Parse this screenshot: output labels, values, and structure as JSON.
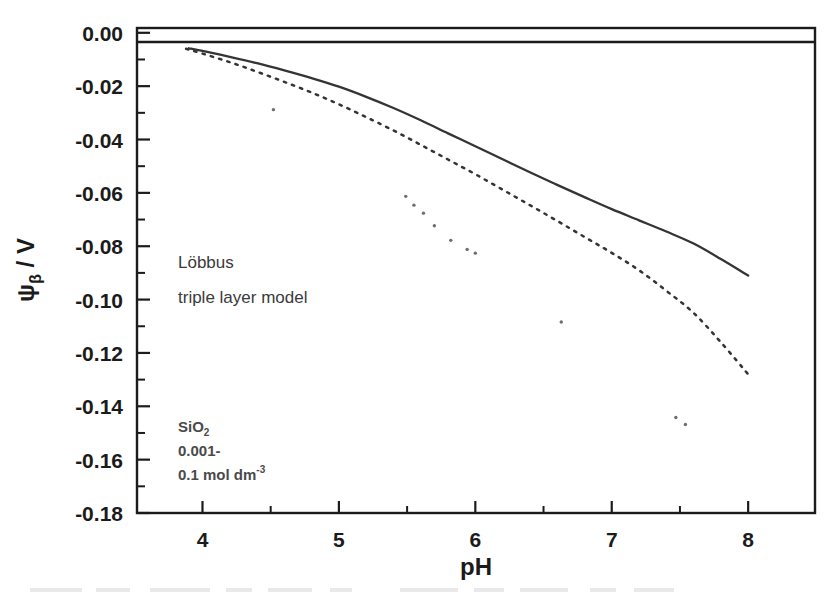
{
  "figure": {
    "kind": "scientific-line-chart",
    "background": "#ffffff",
    "ink_color": "#1b1b1b"
  },
  "axis": {
    "x_title": "pH",
    "y_title_main": "ψ",
    "y_title_sub": "β",
    "y_title_unit": " / V",
    "x_tick_labels": [
      "4",
      "5",
      "6",
      "7",
      "8"
    ],
    "y_tick_labels": [
      "0.00",
      "-0.02",
      "-0.04",
      "-0.06",
      "-0.08",
      "-0.10",
      "-0.12",
      "-0.14",
      "-0.16",
      "-0.18"
    ]
  },
  "annotations": {
    "author": "Löbbus",
    "model": "triple layer model",
    "material": "SiO",
    "material_sub": "2",
    "conc_line1": "0.001-",
    "conc_line2": "0.1 mol dm",
    "conc_sup": "-3"
  },
  "chart_data": {
    "type": "line",
    "title": "",
    "xlabel": "pH",
    "ylabel": "psi_beta / V",
    "xlim": [
      3.52,
      8.49
    ],
    "ylim": [
      -0.18,
      0.0018
    ],
    "x_ticks": [
      4,
      5,
      6,
      7,
      8
    ],
    "x_minor_ticks": [
      3.5,
      4.5,
      5.5,
      6.5,
      7.5,
      8.5
    ],
    "y_ticks": [
      0.0,
      -0.02,
      -0.04,
      -0.06,
      -0.08,
      -0.1,
      -0.12,
      -0.14,
      -0.16,
      -0.18
    ],
    "y_minor_ticks": [
      -0.01,
      -0.03,
      -0.05,
      -0.07,
      -0.09,
      -0.11,
      -0.13,
      -0.15,
      -0.17
    ],
    "grid": false,
    "legend": "none",
    "series": [
      {
        "name": "triple layer model (solid)",
        "style": "solid",
        "color": "#343434",
        "x": [
          3.9,
          4.0,
          4.2,
          4.4,
          4.6,
          4.8,
          5.0,
          5.2,
          5.4,
          5.6,
          5.8,
          6.0,
          6.2,
          6.4,
          6.6,
          6.8,
          7.0,
          7.2,
          7.4,
          7.6,
          7.8,
          8.0
        ],
        "y": [
          -0.0058,
          -0.0068,
          -0.009,
          -0.0114,
          -0.0141,
          -0.017,
          -0.0202,
          -0.024,
          -0.0282,
          -0.0328,
          -0.0377,
          -0.0425,
          -0.0474,
          -0.0523,
          -0.057,
          -0.0616,
          -0.0661,
          -0.0703,
          -0.0745,
          -0.079,
          -0.0848,
          -0.091
        ]
      },
      {
        "name": "triple layer model (dashed)",
        "style": "dashed",
        "color": "#343434",
        "x": [
          3.88,
          4.0,
          4.2,
          4.4,
          4.6,
          4.8,
          5.0,
          5.2,
          5.4,
          5.6,
          5.8,
          6.0,
          6.2,
          6.4,
          6.6,
          6.8,
          7.0,
          7.2,
          7.4,
          7.6,
          7.8,
          8.0
        ],
        "y": [
          -0.006,
          -0.0078,
          -0.011,
          -0.0146,
          -0.0184,
          -0.0224,
          -0.0268,
          -0.0316,
          -0.0366,
          -0.042,
          -0.0475,
          -0.053,
          -0.0588,
          -0.0646,
          -0.0705,
          -0.0765,
          -0.0825,
          -0.089,
          -0.0967,
          -0.105,
          -0.116,
          -0.128
        ]
      }
    ],
    "scatter_points": {
      "name": "measured points (specks)",
      "marker": "dot",
      "color": "#6d6d6d",
      "x": [
        4.52,
        5.49,
        5.55,
        5.62,
        5.7,
        5.82,
        5.94,
        6.0,
        6.63,
        7.47,
        7.54
      ],
      "y": [
        -0.0288,
        -0.0613,
        -0.0646,
        -0.0676,
        -0.0723,
        -0.0778,
        -0.0812,
        -0.0826,
        -0.1084,
        -0.1442,
        -0.1468
      ]
    }
  }
}
